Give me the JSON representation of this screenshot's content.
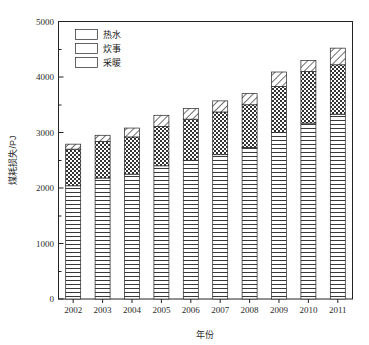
{
  "chart_data": {
    "type": "bar",
    "subtype": "stacked-vertical",
    "title": "",
    "xlabel": "年份",
    "ylabel": "煤耗损失/PJ",
    "categories": [
      "2002",
      "2003",
      "2004",
      "2005",
      "2006",
      "2007",
      "2008",
      "2009",
      "2010",
      "2011"
    ],
    "series": [
      {
        "name": "采暖",
        "pattern": "horizontal-lines",
        "values": [
          2040,
          2180,
          2250,
          2400,
          2500,
          2600,
          2730,
          3000,
          3170,
          3330
        ]
      },
      {
        "name": "炊事",
        "pattern": "checkerboard",
        "values": [
          660,
          660,
          670,
          710,
          740,
          770,
          770,
          830,
          930,
          890
        ]
      },
      {
        "name": "热水",
        "pattern": "diagonal-hatch",
        "values": [
          90,
          110,
          160,
          200,
          190,
          200,
          200,
          260,
          200,
          300
        ]
      }
    ],
    "totals": [
      2790,
      2950,
      3080,
      3310,
      3430,
      3570,
      3700,
      4090,
      4300,
      4520
    ],
    "ylim": [
      0,
      5000
    ],
    "ytick_labels": [
      "0",
      "1000",
      "2000",
      "3000",
      "4000",
      "5000"
    ],
    "ytick_values": [
      0,
      1000,
      2000,
      3000,
      4000,
      5000
    ],
    "yminor_values": [
      500,
      1500,
      2500,
      3500,
      4500
    ],
    "grid": false,
    "legend_position": "top-left",
    "legend_entries": [
      "热水",
      "炊事",
      "采暖"
    ],
    "colors": {
      "line": "#222222",
      "background": "#ffffff",
      "pattern_fill": "#ffffff"
    }
  }
}
